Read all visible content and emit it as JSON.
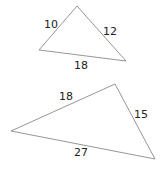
{
  "colors": {
    "line": "#8a8a8a",
    "text": "#222222",
    "background": "#ffffff"
  },
  "triangles": [
    {
      "id": "triangle-1",
      "points": "77,6 39,50 126,61",
      "sides": [
        {
          "label": "10",
          "x": 44,
          "y": 28
        },
        {
          "label": "12",
          "x": 103,
          "y": 35
        },
        {
          "label": "18",
          "x": 74,
          "y": 69
        }
      ]
    },
    {
      "id": "triangle-2",
      "points": "115,84 11,131 155,159",
      "sides": [
        {
          "label": "18",
          "x": 59,
          "y": 100
        },
        {
          "label": "15",
          "x": 134,
          "y": 118
        },
        {
          "label": "27",
          "x": 74,
          "y": 156
        }
      ]
    }
  ]
}
